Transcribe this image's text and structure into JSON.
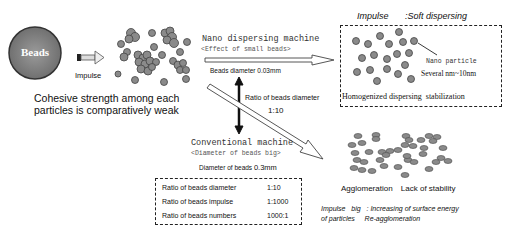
{
  "beads": {
    "label": "Beads",
    "impulse_label": "Impulse"
  },
  "cohesive_text": [
    "Cohesive strength among each",
    "particles is comparatively weak"
  ],
  "nano_machine": {
    "title": "Nano dispersing machine",
    "subtitle": "<Effect of small beads>",
    "beads_diameter": "Beads diameter 0.03mm"
  },
  "ratio": {
    "label": "Ratio of beads diameter",
    "value": "1:10"
  },
  "top_right": {
    "heading_left": "Impulse",
    "heading_right": ":Soft dispersing",
    "nano_particle": "Nano particle",
    "nano_size": "Several nm~10nm",
    "footer": "Homogenized dispersing  stabilization"
  },
  "conventional": {
    "title": "Conventional machine",
    "subtitle": "<Diameter of beads big>",
    "diameter_label": "Diameter of beads",
    "diameter_value": "0.3mm"
  },
  "ratio_table": [
    {
      "label": "Ratio of beads diameter",
      "value": "1:10"
    },
    {
      "label": "Ratio of beads impulse",
      "value": "1:1000"
    },
    {
      "label": "Ratio of beads numbers",
      "value": "1000:1"
    }
  ],
  "bottom_right": {
    "caption_left": "Agglomeration",
    "caption_right": "Lack of stability",
    "note_line1": "Impulse   big   : Increasing of surface energy",
    "note_line2": "of particles     Re-agglomeration"
  },
  "colors": {
    "particle": "#8a8a8a",
    "particle_edge": "#444444",
    "beads": "#808080"
  }
}
